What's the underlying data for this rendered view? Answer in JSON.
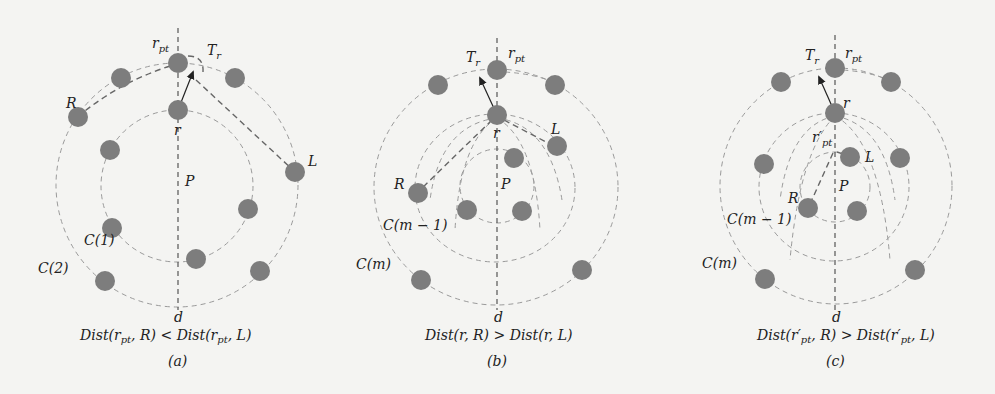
{
  "figure": {
    "colors": {
      "background": "#f4f4f2",
      "node": "#7d7d7d",
      "circle_stroke": "#9a9a9a",
      "axis_stroke": "#555555",
      "arrow": "#222222"
    },
    "panels": [
      {
        "id": "a",
        "label": "(a)",
        "axis_top_label": "r",
        "axis_top_sub": "pt",
        "axis_bottom_label": "d",
        "robot_label": "r",
        "target_label": "T",
        "target_sub": "r",
        "area_label": "P",
        "left_label": "R",
        "right_label": "L",
        "circle_labels": [
          "C(1)",
          "C(2)"
        ],
        "caption_left": "Dist(r",
        "caption_left_sub": "pt",
        "caption_mid": ", R) < Dist(r",
        "caption_right_sub": "pt",
        "caption_end": ", L)"
      },
      {
        "id": "b",
        "label": "(b)",
        "axis_top_label": "r",
        "axis_top_sub": "pt",
        "axis_bottom_label": "d",
        "robot_label": "r",
        "target_label": "T",
        "target_sub": "r",
        "area_label": "P",
        "left_label": "R",
        "right_label": "L",
        "circle_labels": [
          "C(m − 1)",
          "C(m)"
        ],
        "caption": "Dist(r, R) > Dist(r, L)"
      },
      {
        "id": "c",
        "label": "(c)",
        "axis_top_label": "r",
        "axis_top_sub": "pt",
        "axis_bottom_label": "d",
        "robot_label": "r",
        "inner_label": "r′",
        "inner_sub": "pt",
        "target_label": "T",
        "target_sub": "r",
        "area_label": "P",
        "left_label": "R",
        "right_label": "L",
        "circle_labels": [
          "C(m − 1)",
          "C(m)"
        ],
        "caption_left": "Dist(r′",
        "caption_left_sub": "pt",
        "caption_mid": ", R) > Dist(r′",
        "caption_right_sub": "pt",
        "caption_end": ", L)"
      }
    ]
  }
}
